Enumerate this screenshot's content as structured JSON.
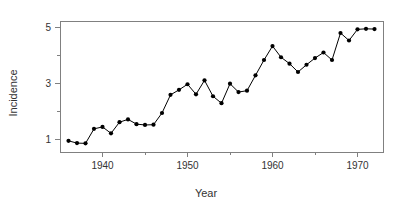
{
  "chart_data": {
    "type": "line",
    "title": "",
    "xlabel": "Year",
    "ylabel": "Incidence",
    "xlim": [
      1935.0,
      1973.0
    ],
    "ylim": [
      0.55,
      5.25
    ],
    "grid": false,
    "legend": "none",
    "markers": "filled-circle",
    "marker_color": "#000000",
    "line_color": "#000000",
    "frame_color": "#808080",
    "xticks": [
      1940,
      1950,
      1960,
      1970
    ],
    "xtick_labels": [
      "1940",
      "1950",
      "1960",
      "1970"
    ],
    "xminor_ticks": [
      1945,
      1955,
      1965
    ],
    "yticks": [
      1,
      3,
      5
    ],
    "ytick_labels": [
      "1",
      "3",
      "5"
    ],
    "yminor_ticks": [
      2,
      4
    ],
    "x": [
      1936,
      1937,
      1938,
      1939,
      1940,
      1941,
      1942,
      1943,
      1944,
      1945,
      1946,
      1947,
      1948,
      1949,
      1950,
      1951,
      1952,
      1953,
      1954,
      1955,
      1956,
      1957,
      1958,
      1959,
      1960,
      1961,
      1962,
      1963,
      1964,
      1965,
      1966,
      1967,
      1968,
      1969,
      1970,
      1971,
      1972
    ],
    "values": [
      0.95,
      0.87,
      0.86,
      1.38,
      1.45,
      1.22,
      1.62,
      1.72,
      1.55,
      1.52,
      1.53,
      1.95,
      2.6,
      2.78,
      2.98,
      2.62,
      3.12,
      2.55,
      2.3,
      3.0,
      2.7,
      2.75,
      3.3,
      3.85,
      4.35,
      3.95,
      3.72,
      3.42,
      3.68,
      3.92,
      4.12,
      3.85,
      4.82,
      4.55,
      4.95,
      4.97,
      4.96
    ]
  },
  "axis": {
    "x_title": "Year",
    "y_title": "Incidence"
  }
}
